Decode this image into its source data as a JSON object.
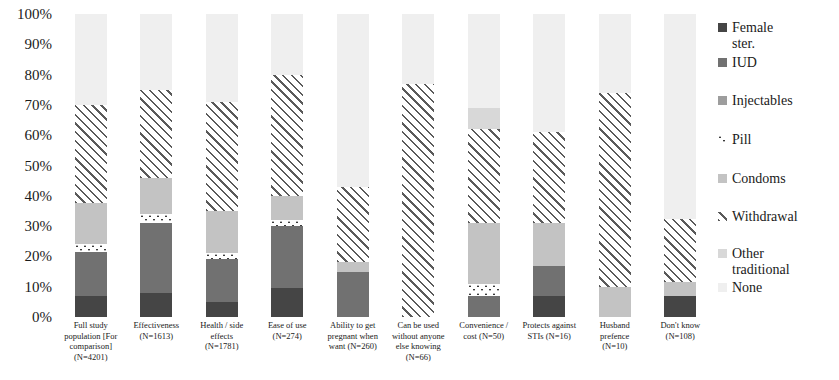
{
  "chart_data": {
    "type": "bar",
    "subtype": "stacked-percent",
    "title": "",
    "xlabel": "",
    "ylabel": "",
    "ylim": [
      0,
      100
    ],
    "grid": false,
    "legend_position": "right",
    "y_ticks": [
      "100%",
      "90%",
      "80%",
      "70%",
      "60%",
      "50%",
      "40%",
      "30%",
      "20%",
      "10%",
      "0%"
    ],
    "y_tick_values": [
      100,
      90,
      80,
      70,
      60,
      50,
      40,
      30,
      20,
      10,
      0
    ],
    "categories": [
      "Full study population [For comparison] (N=4201)",
      "Effectiveness (N=1613)",
      "Health / side effects (N=1781)",
      "Ease of use (N=274)",
      "Ability to get pregnant when want (N=260)",
      "Can be used without anyone else knowing (N=66)",
      "Convenience / cost (N=50)",
      "Protects against STIs (N=16)",
      "Husband prefence (N=10)",
      "Don't know (N=108)"
    ],
    "category_lines": [
      [
        "Full study",
        "population [For",
        "comparison]",
        "(N=4201)"
      ],
      [
        "Effectiveness",
        "(N=1613)"
      ],
      [
        "Health / side",
        "effects",
        "(N=1781)"
      ],
      [
        "Ease of use",
        "(N=274)"
      ],
      [
        "Ability to get",
        "pregnant when",
        "want (N=260)"
      ],
      [
        "Can be used",
        "without anyone",
        "else knowing",
        "(N=66)"
      ],
      [
        "Convenience /",
        "cost (N=50)"
      ],
      [
        "Protects against",
        "STIs (N=16)"
      ],
      [
        "Husband",
        "prefence",
        "(N=10)"
      ],
      [
        "Don't know",
        "(N=108)"
      ]
    ],
    "series": [
      {
        "name": "Female ster.",
        "key": "female",
        "color": "#454545",
        "pattern": "solid",
        "values": [
          7,
          8,
          5,
          9.5,
          0,
          0,
          0,
          7,
          0,
          7
        ]
      },
      {
        "name": "IUD",
        "key": "iud",
        "color": "#717171",
        "pattern": "solid",
        "values": [
          14.5,
          23,
          14,
          20.5,
          15,
          0,
          7,
          10,
          0,
          0
        ]
      },
      {
        "name": "Injectables",
        "key": "inject",
        "color": "#9d9d9d",
        "pattern": "solid",
        "values": [
          0,
          0,
          0,
          0,
          0,
          0,
          0,
          0,
          0,
          0
        ]
      },
      {
        "name": "Pill",
        "key": "pill",
        "color": "#3a3a3a",
        "pattern": "dots",
        "values": [
          2.5,
          3,
          2,
          2,
          0,
          0,
          4,
          0,
          0,
          0
        ]
      },
      {
        "name": "Condoms",
        "key": "condoms",
        "color": "#c3c3c3",
        "pattern": "solid",
        "values": [
          13.5,
          12,
          14,
          8,
          3,
          0,
          20,
          14,
          10,
          4.5
        ]
      },
      {
        "name": "Withdrawal",
        "key": "withdrawal",
        "color": "#5a5a5a",
        "pattern": "hatch",
        "values": [
          32.5,
          29,
          36,
          40,
          25,
          77,
          31,
          30,
          64,
          21
        ]
      },
      {
        "name": "Other traditional",
        "key": "othertrad",
        "color": "#d8d8d8",
        "pattern": "solid",
        "values": [
          0,
          0,
          0,
          0,
          0,
          0,
          7,
          0,
          0,
          0
        ]
      },
      {
        "name": "None",
        "key": "none",
        "color": "#efefef",
        "pattern": "solid",
        "values": [
          30,
          25,
          29,
          20,
          57,
          23,
          31,
          39,
          26,
          67.5
        ]
      }
    ]
  },
  "legend": {
    "items": [
      {
        "label": "Female\nster.",
        "key": "female",
        "y": 12
      },
      {
        "label": "IUD",
        "key": "iud",
        "y": 47
      },
      {
        "label": "Injectables",
        "key": "inject",
        "y": 85
      },
      {
        "label": "Pill",
        "key": "pill",
        "y": 124
      },
      {
        "label": "Condoms",
        "key": "condoms",
        "y": 163
      },
      {
        "label": "Withdrawal",
        "key": "withdrawal",
        "y": 201
      },
      {
        "label": "Other\ntraditional",
        "key": "othertrad",
        "y": 238
      },
      {
        "label": "None",
        "key": "none",
        "y": 272
      }
    ]
  }
}
